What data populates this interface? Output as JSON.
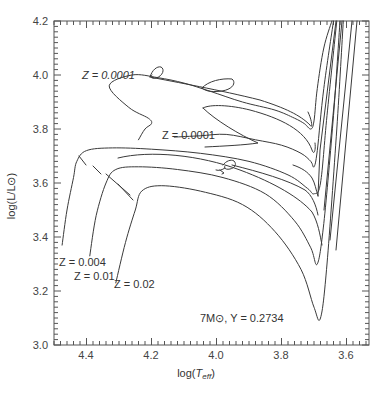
{
  "chart_data": {
    "type": "line",
    "title": "",
    "xlabel": "log(T_eff)",
    "ylabel": "log(L/L_⊙)",
    "xlim": [
      4.5,
      3.53
    ],
    "ylim": [
      3.0,
      4.2
    ],
    "x_inverted": true,
    "grid": false,
    "legend": "none (inline labels)",
    "x_ticks": [
      4.4,
      4.2,
      4.0,
      3.8,
      3.6
    ],
    "x_tick_labels": [
      "4.4",
      "4.2",
      "4.0",
      "3.8",
      "3.6"
    ],
    "y_ticks": [
      3.0,
      3.2,
      3.4,
      3.6,
      3.8,
      4.0,
      4.2
    ],
    "y_tick_labels": [
      "3.0",
      "3.2",
      "3.4",
      "3.6",
      "3.8",
      "4.0",
      "4.2"
    ],
    "annotations": [
      {
        "text": "Z = 0.0001",
        "at": [
          4.35,
          4.0
        ]
      },
      {
        "text": "Z = 0.0001",
        "at": [
          4.05,
          3.79
        ]
      },
      {
        "text": "Z = 0.004",
        "at": [
          4.48,
          3.3
        ]
      },
      {
        "text": "Z = 0.01",
        "at": [
          4.44,
          3.25
        ]
      },
      {
        "text": "Z = 0.02",
        "at": [
          4.33,
          3.22
        ]
      },
      {
        "text": "7M⊙, Y = 0.2734",
        "at": [
          4.05,
          3.09
        ]
      }
    ],
    "series": [
      {
        "name": "Z=0.0001 (a)",
        "x": [
          4.24,
          4.22,
          4.2,
          4.21,
          4.27,
          4.33,
          4.26,
          4.18,
          4.1,
          4.02,
          3.92,
          3.82,
          3.76,
          3.73,
          3.71,
          3.7,
          3.69,
          3.67,
          3.645
        ],
        "y": [
          3.76,
          3.8,
          3.82,
          3.84,
          3.88,
          3.96,
          4.0,
          3.99,
          3.97,
          3.94,
          3.9,
          3.87,
          3.84,
          3.82,
          3.8,
          3.83,
          3.95,
          4.1,
          4.2
        ]
      },
      {
        "name": "Z=0.0001 (b)",
        "x": [
          4.13,
          4.05,
          3.97,
          3.88,
          3.8,
          3.74,
          3.71,
          3.7,
          3.69,
          3.67,
          3.64
        ],
        "y": [
          3.77,
          3.775,
          3.78,
          3.76,
          3.74,
          3.71,
          3.68,
          3.66,
          3.72,
          3.95,
          4.2
        ]
      },
      {
        "name": "Z=0.004",
        "x": [
          4.475,
          4.46,
          4.44,
          4.43,
          4.4,
          4.32,
          4.2,
          4.05,
          3.9,
          3.78,
          3.72,
          3.7,
          3.68,
          3.66,
          3.63
        ],
        "y": [
          3.37,
          3.5,
          3.62,
          3.68,
          3.72,
          3.73,
          3.725,
          3.71,
          3.68,
          3.63,
          3.58,
          3.56,
          3.6,
          3.85,
          4.2
        ]
      },
      {
        "name": "Z=0.01",
        "x": [
          4.39,
          4.37,
          4.34,
          4.31,
          4.24,
          4.12,
          3.98,
          3.85,
          3.76,
          3.71,
          3.69,
          3.67,
          3.64,
          3.62
        ],
        "y": [
          3.33,
          3.48,
          3.6,
          3.65,
          3.66,
          3.65,
          3.62,
          3.56,
          3.46,
          3.36,
          3.3,
          3.45,
          3.85,
          4.2
        ]
      },
      {
        "name": "Z=0.02",
        "x": [
          4.31,
          4.28,
          4.25,
          4.23,
          4.17,
          4.05,
          3.92,
          3.82,
          3.74,
          3.7,
          3.68,
          3.66,
          3.63,
          3.61
        ],
        "y": [
          3.23,
          3.38,
          3.5,
          3.57,
          3.59,
          3.57,
          3.52,
          3.42,
          3.28,
          3.14,
          3.1,
          3.3,
          3.8,
          4.2
        ]
      }
    ]
  },
  "axes": {
    "xlabel_prefix": "log(",
    "xlabel_T": "T",
    "xlabel_sub": "eff",
    "xlabel_suffix": ")",
    "ylabel": "log(L/L⊙)",
    "x_ticks": [
      "4.4",
      "4.2",
      "4.0",
      "3.8",
      "3.6"
    ],
    "y_ticks": [
      "4.2",
      "4.0",
      "3.8",
      "3.6",
      "3.4",
      "3.2",
      "3.0"
    ]
  },
  "labels": {
    "z_top": "Z = 0.0001",
    "z_mid": "Z = 0.0001",
    "z_004": "Z = 0.004",
    "z_01": "Z = 0.01",
    "z_02": "Z = 0.02",
    "mass_info": "7M⊙, Y = 0.2734"
  },
  "colors": {
    "line": "#3a3a3a",
    "frame": "#555555",
    "text": "#333333"
  }
}
